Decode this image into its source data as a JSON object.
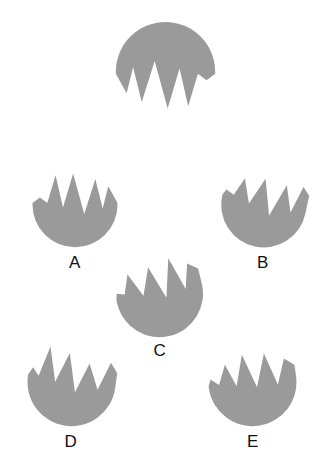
{
  "page": {
    "background_color": "#ffffff",
    "width": 333,
    "height": 470
  },
  "style": {
    "shape_fill": "#9a9a9a",
    "label_color": "#111111"
  },
  "target": {
    "name": "target-shape",
    "label": "",
    "rotation_deg": 180,
    "description": "gray notched dome shape, flat-ish top with spikes pointing down"
  },
  "options": [
    {
      "id": "a",
      "label": "A",
      "rotation_deg": 0,
      "description": "gray notched bowl shape with three upward spikes"
    },
    {
      "id": "b",
      "label": "B",
      "rotation_deg": 12,
      "description": "gray notched bowl shape rotated slightly clockwise"
    },
    {
      "id": "c",
      "label": "C",
      "rotation_deg": -14,
      "description": "gray notched bowl shape rotated slightly counter-clockwise"
    },
    {
      "id": "d",
      "label": "D",
      "rotation_deg": 8,
      "description": "gray notched bowl shape, mirrored notch pattern"
    },
    {
      "id": "e",
      "label": "E",
      "rotation_deg": -8,
      "description": "gray notched bowl shape, narrow center spike"
    }
  ],
  "shape_paths": {
    "bowl_primary": "M 4,42 A 46,46 0 0 0 96,42 L 96,40 L 86,22 L 80,46 L 72,14 L 60,52 L 48,8 L 37,45 L 29,10 L 20,40 L 12,34 L 4,40 Z",
    "bowl_b": "M 4,42 A 46,46 0 0 0 96,42 L 96,22 L 88,14 L 80,44 L 70,16 L 58,52 L 46,14 L 34,44 L 24,18 L 16,38 L 7,34 L 4,40 Z",
    "bowl_c": "M 4,44 A 46,46 0 0 0 96,44 L 96,28 L 86,20 L 78,46 L 68,10 L 56,50 L 45,14 L 33,42 L 22,16 L 14,36 L 6,33 L 4,40 Z",
    "bowl_d": "M 4,42 A 46,46 0 0 0 96,42 L 96,26 L 88,16 L 78,46 L 66,20 L 55,52 L 44,12 L 33,44 L 23,8 L 15,40 L 8,32 L 4,40 Z",
    "bowl_e": "M 4,42 A 46,46 0 0 0 96,42 L 96,30 L 86,22 L 76,48 L 66,14 L 54,48 L 43,12 L 33,44 L 24,20 L 15,40 L 7,33 L 4,40 Z"
  }
}
